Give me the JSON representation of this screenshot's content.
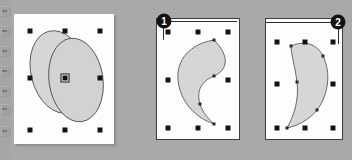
{
  "app": {
    "background_color": "#a9a9a9",
    "page_color": "#fdfdfd",
    "shape_fill_color": "#d6d6d6",
    "shape_stroke_color": "#59595b",
    "handle_color": "#121212",
    "badge_color": "#111111"
  },
  "toolstrip": {
    "name": "cropped-tool-palette",
    "tools": [
      {
        "label": ""
      },
      {
        "label": ""
      },
      {
        "label": ""
      },
      {
        "label": ""
      },
      {
        "label": ""
      },
      {
        "label": ""
      },
      {
        "label": ""
      }
    ]
  },
  "panels": [
    {
      "id": "panel-1",
      "badge": null,
      "title": "two-overlapping-ellipses-selected",
      "shapes": [
        {
          "name": "ellipse-back",
          "fill": "#d6d6d6",
          "stroke": "#59595b"
        },
        {
          "name": "ellipse-front",
          "fill": "#d2d2d2",
          "stroke": "#4e4e50"
        }
      ],
      "handle_count": 8,
      "has_center_handle": true
    },
    {
      "id": "panel-2",
      "badge": "1",
      "title": "crescent-shape-convex-left",
      "shapes": [
        {
          "name": "crescent-left",
          "fill": "#d6d6d6",
          "stroke": "#59595b"
        }
      ],
      "handle_count": 8,
      "has_center_handle": false
    },
    {
      "id": "panel-3",
      "badge": "2",
      "title": "crescent-shape-convex-right",
      "shapes": [
        {
          "name": "crescent-right",
          "fill": "#d6d6d6",
          "stroke": "#59595b"
        }
      ],
      "handle_count": 8,
      "has_center_handle": false
    }
  ]
}
